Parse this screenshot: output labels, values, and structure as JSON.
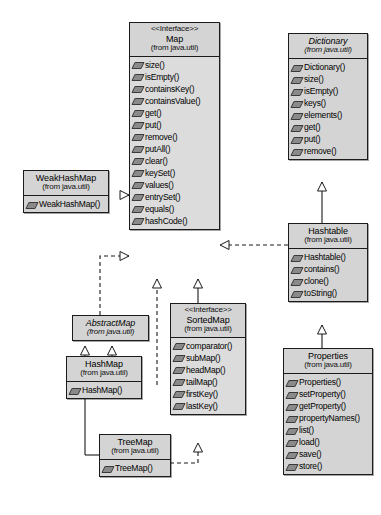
{
  "diagram": {
    "notation": "UML",
    "colors": {
      "box_fill": "#d4d4d4",
      "box_border": "#1b1b1b",
      "line": "#1b1b1b",
      "page_background": "#ffffff"
    },
    "classes": [
      {
        "id": "map",
        "stereotype": "<<Interface>>",
        "name": "Map",
        "package": "(from java.util)",
        "abstract": false,
        "operations": [
          "size()",
          "isEmpty()",
          "containsKey()",
          "containsValue()",
          "get()",
          "put()",
          "remove()",
          "putAll()",
          "clear()",
          "keySet()",
          "values()",
          "entrySet()",
          "equals()",
          "hashCode()"
        ]
      },
      {
        "id": "dictionary",
        "stereotype": "",
        "name": "Dictionary",
        "package": "(from java.util)",
        "abstract": true,
        "operations": [
          "Dictionary()",
          "size()",
          "isEmpty()",
          "keys()",
          "elements()",
          "get()",
          "put()",
          "remove()"
        ]
      },
      {
        "id": "weakhashmap",
        "stereotype": "",
        "name": "WeakHashMap",
        "package": "(from java.util)",
        "abstract": false,
        "operations": [
          "WeakHashMap()"
        ]
      },
      {
        "id": "hashtable",
        "stereotype": "",
        "name": "Hashtable",
        "package": "(from java.util)",
        "abstract": false,
        "operations": [
          "Hashtable()",
          "contains()",
          "clone()",
          "toString()"
        ]
      },
      {
        "id": "abstractmap",
        "stereotype": "",
        "name": "AbstractMap",
        "package": "(from java.util)",
        "abstract": true,
        "operations": []
      },
      {
        "id": "sortedmap",
        "stereotype": "<<Interface>>",
        "name": "SortedMap",
        "package": "(from java.util)",
        "abstract": false,
        "operations": [
          "comparator()",
          "subMap()",
          "headMap()",
          "tailMap()",
          "firstKey()",
          "lastKey()"
        ]
      },
      {
        "id": "properties",
        "stereotype": "",
        "name": "Properties",
        "package": "(from java.util)",
        "abstract": false,
        "operations": [
          "Properties()",
          "setProperty()",
          "getProperty()",
          "propertyNames()",
          "list()",
          "load()",
          "save()",
          "store()"
        ]
      },
      {
        "id": "hashmap",
        "stereotype": "",
        "name": "HashMap",
        "package": "(from java.util)",
        "abstract": false,
        "operations": [
          "HashMap()"
        ]
      },
      {
        "id": "treemap",
        "stereotype": "",
        "name": "TreeMap",
        "package": "(from java.util)",
        "abstract": false,
        "operations": [
          "TreeMap()"
        ]
      }
    ],
    "relationships": [
      {
        "from": "weakhashmap",
        "to": "map",
        "type": "realization"
      },
      {
        "from": "abstractmap",
        "to": "map",
        "type": "realization"
      },
      {
        "from": "hashtable",
        "to": "map",
        "type": "realization"
      },
      {
        "from": "hashmap",
        "to": "map",
        "type": "realization"
      },
      {
        "from": "sortedmap",
        "to": "map",
        "type": "generalization"
      },
      {
        "from": "hashtable",
        "to": "dictionary",
        "type": "generalization"
      },
      {
        "from": "properties",
        "to": "hashtable",
        "type": "generalization"
      },
      {
        "from": "hashmap",
        "to": "abstractmap",
        "type": "generalization"
      },
      {
        "from": "treemap",
        "to": "abstractmap",
        "type": "generalization"
      },
      {
        "from": "treemap",
        "to": "sortedmap",
        "type": "realization"
      }
    ]
  }
}
